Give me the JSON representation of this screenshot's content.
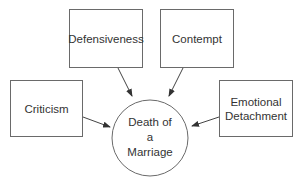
{
  "diagram": {
    "center": {
      "label_lines": [
        "Death of",
        "a",
        "Marriage"
      ]
    },
    "factors": [
      {
        "id": "criticism",
        "lines": [
          "Criticism"
        ]
      },
      {
        "id": "defensiveness",
        "lines": [
          "Defensiveness"
        ]
      },
      {
        "id": "contempt",
        "lines": [
          "Contempt"
        ]
      },
      {
        "id": "emotional-detachment",
        "lines": [
          "Emotional",
          "Detachment"
        ]
      }
    ],
    "edges": [
      {
        "from": "criticism",
        "to": "center"
      },
      {
        "from": "defensiveness",
        "to": "center"
      },
      {
        "from": "contempt",
        "to": "center"
      },
      {
        "from": "emotional-detachment",
        "to": "center"
      }
    ],
    "colors": {
      "stroke": "#6a6a6a",
      "text": "#333333",
      "background": "#ffffff"
    }
  }
}
